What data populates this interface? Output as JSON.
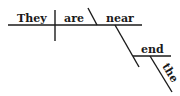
{
  "diagram": {
    "type": "sentence-diagram",
    "sentence": "They are near the end",
    "words": {
      "subject": "They",
      "verb": "are",
      "complement": "near",
      "object": "end",
      "modifier": "the"
    },
    "colors": {
      "ink": "#1a1a1a",
      "background": "#ffffff"
    }
  }
}
